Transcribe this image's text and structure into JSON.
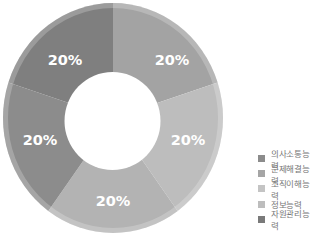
{
  "chart_data": {
    "type": "pie",
    "subtype": "donut",
    "title": "",
    "categories": [
      "의사소통능력",
      "문제해결능력",
      "조직이해능력",
      "정보능력",
      "자원관리능력"
    ],
    "values": [
      20,
      20,
      20,
      20,
      20
    ],
    "labels": [
      "20%",
      "20%",
      "20%",
      "20%",
      "20%"
    ],
    "colors": [
      "#a3a3a3",
      "#bdbdbd",
      "#b3b3b3",
      "#8c8c8c",
      "#7f7f7f"
    ],
    "legend_colors": [
      "#8c8c8c",
      "#a5a5a5",
      "#c4c4c4",
      "#bdbdbd",
      "#7a7a7a"
    ],
    "start_angle_deg": 0,
    "direction": "clockwise",
    "legend_position": "right-bottom"
  },
  "legend": {
    "items": [
      {
        "label": "의사소통능력",
        "color": "#8c8c8c"
      },
      {
        "label": "문제해결능력",
        "color": "#a5a5a5"
      },
      {
        "label": "조직이해능력",
        "color": "#c4c4c4"
      },
      {
        "label": "정보능력",
        "color": "#bdbdbd"
      },
      {
        "label": "자원관리능력",
        "color": "#7a7a7a"
      }
    ]
  },
  "slice_labels": [
    "20%",
    "20%",
    "20%",
    "20%",
    "20%"
  ]
}
